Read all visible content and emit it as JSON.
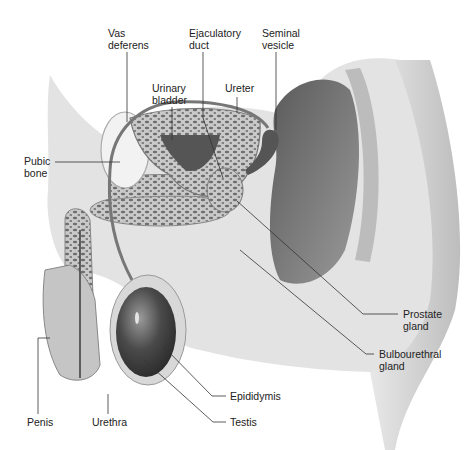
{
  "diagram": {
    "type": "anatomical-illustration",
    "labels": [
      {
        "id": "vas-deferens",
        "text": "Vas\ndeferens",
        "x": 108,
        "y": 27
      },
      {
        "id": "ejaculatory-duct",
        "text": "Ejaculatory\nduct",
        "x": 189,
        "y": 27
      },
      {
        "id": "seminal-vesicle",
        "text": "Seminal\nvesicle",
        "x": 262,
        "y": 27
      },
      {
        "id": "urinary-bladder",
        "text": "Urinary\nbladder",
        "x": 152,
        "y": 82
      },
      {
        "id": "ureter",
        "text": "Ureter",
        "x": 225,
        "y": 82
      },
      {
        "id": "pubic-bone",
        "text": "Pubic\nbone",
        "x": 24,
        "y": 155
      },
      {
        "id": "prostate-gland",
        "text": "Prostate\ngland",
        "x": 403,
        "y": 311
      },
      {
        "id": "bulbourethral-gland",
        "text": "Bulbourethral\ngland",
        "x": 379,
        "y": 351
      },
      {
        "id": "epididymis",
        "text": "Epididymis",
        "x": 230,
        "y": 392
      },
      {
        "id": "testis",
        "text": "Testis",
        "x": 230,
        "y": 418
      },
      {
        "id": "penis",
        "text": "Penis",
        "x": 27,
        "y": 418
      },
      {
        "id": "urethra",
        "text": "Urethra",
        "x": 92,
        "y": 418
      }
    ]
  }
}
